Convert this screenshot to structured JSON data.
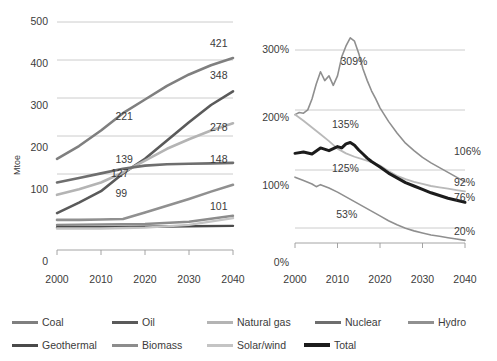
{
  "chart_data": [
    {
      "id": "left",
      "type": "line",
      "title": "",
      "xlabel": "",
      "ylabel": "Mtoe",
      "x": [
        2000,
        2010,
        2020,
        2030,
        2040
      ],
      "xticks": [
        "2000",
        "2010",
        "2020",
        "2030",
        "2040"
      ],
      "yticks": [
        "0",
        "100",
        "200",
        "300",
        "400",
        "500"
      ],
      "ylim": [
        0,
        500
      ],
      "xlim": [
        2000,
        2040
      ],
      "grid": true,
      "legend": "bottom",
      "series": [
        {
          "name": "Coal",
          "color": "#7f7f7f",
          "width": 2.6,
          "points": [
            [
              2000,
              200
            ],
            [
              2005,
              228
            ],
            [
              2010,
              262
            ],
            [
              2015,
              300
            ],
            [
              2020,
              330
            ],
            [
              2025,
              360
            ],
            [
              2030,
              385
            ],
            [
              2035,
              405
            ],
            [
              2040,
              421
            ]
          ],
          "end_label": "421"
        },
        {
          "name": "Oil",
          "color": "#5a5a5a",
          "width": 2.6,
          "points": [
            [
              2000,
              81
            ],
            [
              2005,
              104
            ],
            [
              2010,
              129
            ],
            [
              2015,
              168
            ],
            [
              2020,
              200
            ],
            [
              2025,
              240
            ],
            [
              2030,
              280
            ],
            [
              2035,
              318
            ],
            [
              2040,
              348
            ]
          ],
          "end_label": "348"
        },
        {
          "name": "Natural gas",
          "color": "#b4b4b4",
          "width": 2.6,
          "points": [
            [
              2000,
              121
            ],
            [
              2005,
              133
            ],
            [
              2010,
              148
            ],
            [
              2015,
              170
            ],
            [
              2020,
              196
            ],
            [
              2025,
              222
            ],
            [
              2030,
              243
            ],
            [
              2035,
              262
            ],
            [
              2040,
              278
            ]
          ],
          "end_label": "278"
        },
        {
          "name": "Nuclear",
          "color": "#6e6e6e",
          "width": 2.6,
          "points": [
            [
              2000,
              148
            ],
            [
              2005,
              158
            ],
            [
              2010,
              168
            ],
            [
              2015,
              178
            ],
            [
              2020,
              185
            ],
            [
              2025,
              188
            ],
            [
              2030,
              189
            ],
            [
              2035,
              190
            ],
            [
              2040,
              191
            ]
          ],
          "end_label": "148"
        },
        {
          "name": "Hydro",
          "color": "#909090",
          "width": 2.6,
          "points": [
            [
              2000,
              66
            ],
            [
              2005,
              66
            ],
            [
              2010,
              67
            ],
            [
              2015,
              68
            ],
            [
              2020,
              82
            ],
            [
              2025,
              97
            ],
            [
              2030,
              112
            ],
            [
              2035,
              128
            ],
            [
              2040,
              143
            ]
          ],
          "end_label": "101"
        },
        {
          "name": "Geothermal",
          "color": "#4a4a4a",
          "width": 2.4,
          "points": [
            [
              2000,
              50
            ],
            [
              2010,
              50
            ],
            [
              2020,
              51
            ],
            [
              2030,
              52
            ],
            [
              2040,
              53
            ]
          ],
          "end_label": ""
        },
        {
          "name": "Biomass",
          "color": "#8c8c8c",
          "width": 2.4,
          "points": [
            [
              2000,
              55
            ],
            [
              2010,
              56
            ],
            [
              2020,
              57
            ],
            [
              2030,
              62
            ],
            [
              2040,
              75
            ]
          ],
          "end_label": ""
        },
        {
          "name": "Solar/wind",
          "color": "#c4c4c4",
          "width": 2.4,
          "points": [
            [
              2000,
              47
            ],
            [
              2010,
              47
            ],
            [
              2020,
              49
            ],
            [
              2030,
              55
            ],
            [
              2040,
              70
            ]
          ],
          "end_label": ""
        }
      ],
      "inner_labels": [
        {
          "text": "221",
          "x": 2016,
          "y": 292
        },
        {
          "text": "139",
          "x": 2016,
          "y": 197
        },
        {
          "text": "127",
          "x": 2015,
          "y": 167
        },
        {
          "text": "99",
          "x": 2016,
          "y": 122
        }
      ]
    },
    {
      "id": "right",
      "type": "line",
      "title": "",
      "xlabel": "",
      "ylabel": "",
      "xticks": [
        "2000",
        "2010",
        "2020",
        "2030",
        "2040"
      ],
      "yticks": [
        "0%",
        "100%",
        "200%",
        "300%"
      ],
      "ylim": [
        0,
        340
      ],
      "xlim": [
        2000,
        2040
      ],
      "grid": true,
      "legend": "bottom",
      "series": [
        {
          "name": "Solar/wind-index",
          "color": "#8f8f8f",
          "width": 1.6,
          "points": [
            [
              2000,
              205
            ],
            [
              2001,
              208
            ],
            [
              2002,
              207
            ],
            [
              2003,
              212
            ],
            [
              2004,
              228
            ],
            [
              2005,
              250
            ],
            [
              2006,
              268
            ],
            [
              2007,
              255
            ],
            [
              2008,
              262
            ],
            [
              2009,
              248
            ],
            [
              2010,
              262
            ],
            [
              2011,
              290
            ],
            [
              2012,
              306
            ],
            [
              2013,
              318
            ],
            [
              2014,
              313
            ],
            [
              2015,
              295
            ],
            [
              2016,
              272
            ],
            [
              2017,
              255
            ],
            [
              2018,
              240
            ],
            [
              2019,
              228
            ],
            [
              2020,
              215
            ],
            [
              2022,
              195
            ],
            [
              2024,
              178
            ],
            [
              2026,
              163
            ],
            [
              2028,
              152
            ],
            [
              2030,
              142
            ],
            [
              2032,
              134
            ],
            [
              2034,
              127
            ],
            [
              2036,
              120
            ],
            [
              2038,
              113
            ],
            [
              2040,
              106
            ]
          ],
          "end_label": "106%"
        },
        {
          "name": "Nuclear-index",
          "color": "#b9b9b9",
          "width": 1.8,
          "points": [
            [
              2000,
              205
            ],
            [
              2002,
              196
            ],
            [
              2004,
              186
            ],
            [
              2006,
              176
            ],
            [
              2008,
              166
            ],
            [
              2010,
              155
            ],
            [
              2012,
              148
            ],
            [
              2014,
              143
            ],
            [
              2016,
              139
            ],
            [
              2018,
              135
            ],
            [
              2020,
              130
            ],
            [
              2022,
              122
            ],
            [
              2024,
              115
            ],
            [
              2026,
              110
            ],
            [
              2028,
              106
            ],
            [
              2030,
              103
            ],
            [
              2032,
              100
            ],
            [
              2034,
              98
            ],
            [
              2036,
              96
            ],
            [
              2038,
              94
            ],
            [
              2040,
              92
            ]
          ],
          "end_label": "92%"
        },
        {
          "name": "Total",
          "color": "#1c1c1c",
          "width": 3.0,
          "points": [
            [
              2000,
              148
            ],
            [
              2002,
              150
            ],
            [
              2004,
              147
            ],
            [
              2006,
              156
            ],
            [
              2008,
              152
            ],
            [
              2010,
              158
            ],
            [
              2011,
              156
            ],
            [
              2012,
              162
            ],
            [
              2013,
              164
            ],
            [
              2014,
              160
            ],
            [
              2015,
              153
            ],
            [
              2016,
              147
            ],
            [
              2017,
              141
            ],
            [
              2018,
              136
            ],
            [
              2020,
              128
            ],
            [
              2022,
              119
            ],
            [
              2024,
              112
            ],
            [
              2026,
              105
            ],
            [
              2028,
              100
            ],
            [
              2030,
              95
            ],
            [
              2032,
              90
            ],
            [
              2034,
              86
            ],
            [
              2036,
              82
            ],
            [
              2038,
              79
            ],
            [
              2040,
              76
            ]
          ],
          "end_label": "76%"
        },
        {
          "name": "Hydro-index",
          "color": "#8f8f8f",
          "width": 1.6,
          "points": [
            [
              2000,
              113
            ],
            [
              2002,
              108
            ],
            [
              2004,
              103
            ],
            [
              2005,
              99
            ],
            [
              2006,
              102
            ],
            [
              2008,
              97
            ],
            [
              2010,
              91
            ],
            [
              2012,
              84
            ],
            [
              2014,
              77
            ],
            [
              2016,
              70
            ],
            [
              2018,
              63
            ],
            [
              2020,
              56
            ],
            [
              2022,
              49
            ],
            [
              2024,
              43
            ],
            [
              2026,
              38
            ],
            [
              2028,
              34
            ],
            [
              2030,
              31
            ],
            [
              2032,
              28
            ],
            [
              2034,
              26
            ],
            [
              2036,
              24
            ],
            [
              2038,
              22
            ],
            [
              2040,
              20
            ]
          ],
          "end_label": "20%"
        }
      ],
      "inner_labels": [
        {
          "text": "309%",
          "x": 2014,
          "y": 283
        },
        {
          "text": "135%",
          "x": 2012,
          "y": 190
        },
        {
          "text": "125%",
          "x": 2012,
          "y": 125
        },
        {
          "text": "53%",
          "x": 2013,
          "y": 58
        }
      ]
    }
  ],
  "legend": {
    "items": [
      {
        "label": "Coal",
        "color": "#7f7f7f",
        "width": 3
      },
      {
        "label": "Oil",
        "color": "#5a5a5a",
        "width": 3
      },
      {
        "label": "Natural gas",
        "color": "#b4b4b4",
        "width": 3
      },
      {
        "label": "Nuclear",
        "color": "#6e6e6e",
        "width": 3
      },
      {
        "label": "Hydro",
        "color": "#909090",
        "width": 3
      },
      {
        "label": "Geothermal",
        "color": "#4a4a4a",
        "width": 3
      },
      {
        "label": "Biomass",
        "color": "#8c8c8c",
        "width": 3
      },
      {
        "label": "Solar/wind",
        "color": "#c4c4c4",
        "width": 3
      },
      {
        "label": "Total",
        "color": "#1c1c1c",
        "width": 4
      }
    ]
  }
}
